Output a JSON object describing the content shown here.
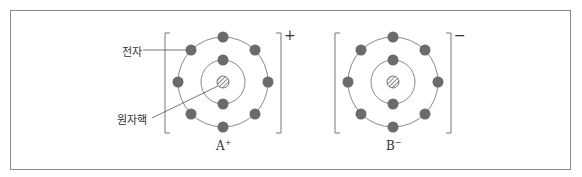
{
  "diagram": {
    "labels": {
      "electron": "전자",
      "nucleus": "원자핵"
    },
    "atoms": [
      {
        "name": "A",
        "charge_symbol": "+",
        "sup": "+",
        "cx": 223,
        "cy": 82,
        "inner_electrons": 2,
        "outer_electrons": 8
      },
      {
        "name": "B",
        "charge_symbol": "−",
        "sup": "−",
        "cx": 393,
        "cy": 82,
        "inner_electrons": 2,
        "outer_electrons": 8
      }
    ],
    "colors": {
      "electron": "#6b6b6b",
      "orbit": "#888888",
      "line": "#555555",
      "frame": "#8a8a8a"
    }
  }
}
